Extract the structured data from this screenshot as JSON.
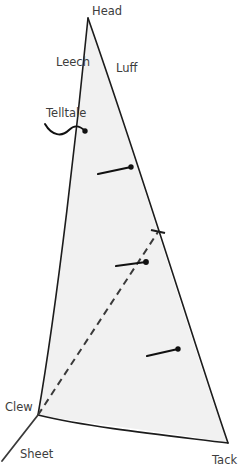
{
  "diagram": {
    "type": "line-diagram",
    "colors": {
      "sail_fill": "#f1f1f1",
      "outline": "#1c1c1c",
      "label_text": "#3d3d3d",
      "telltale": "#111111",
      "dashed_line": "#3a3a3a",
      "background": "#ffffff"
    },
    "labels": {
      "head": "Head",
      "leech": "Leech",
      "luff": "Luff",
      "telltale": "Telltale",
      "clew": "Clew",
      "sheet": "Sheet",
      "tack": "Tack"
    },
    "label_positions": {
      "head": {
        "x": 92,
        "y": 15
      },
      "leech": {
        "x": 56,
        "y": 66
      },
      "luff": {
        "x": 116,
        "y": 72
      },
      "telltale": {
        "x": 46,
        "y": 117
      },
      "clew": {
        "x": 5,
        "y": 411
      },
      "sheet": {
        "x": 20,
        "y": 458
      },
      "tack": {
        "x": 212,
        "y": 464
      }
    },
    "corners": {
      "head": {
        "x": 88,
        "y": 18
      },
      "clew": {
        "x": 38,
        "y": 415
      },
      "tack": {
        "x": 228,
        "y": 443
      }
    },
    "edges": {
      "leech": {
        "from": "head",
        "to": "clew",
        "curve": "near-straight"
      },
      "luff": {
        "from": "head",
        "to": "tack",
        "curve": "convex-right"
      },
      "foot": {
        "from": "clew",
        "to": "tack",
        "curve": "sagging-down"
      }
    },
    "sheet_line": {
      "x1": 38,
      "y1": 415,
      "x2": 2,
      "y2": 461
    },
    "draft_stripe": {
      "style": "dashed",
      "from": {
        "x": 38,
        "y": 415
      },
      "to": {
        "x": 158,
        "y": 232
      }
    },
    "luff_tick": {
      "x": 158,
      "y": 232,
      "length": 13
    },
    "telltales": [
      {
        "name": "leech-telltale",
        "dot": {
          "x": 85,
          "y": 131
        },
        "style": "wavy",
        "tail_x": 45,
        "tail_y": 124
      },
      {
        "name": "upper-telltale",
        "dot": {
          "x": 131,
          "y": 167
        },
        "style": "straight",
        "tail_x": 98,
        "tail_y": 174
      },
      {
        "name": "middle-telltale",
        "dot": {
          "x": 146,
          "y": 262
        },
        "style": "straight",
        "tail_x": 116,
        "tail_y": 266
      },
      {
        "name": "lower-telltale",
        "dot": {
          "x": 178,
          "y": 349
        },
        "style": "straight",
        "tail_x": 147,
        "tail_y": 356
      }
    ]
  }
}
